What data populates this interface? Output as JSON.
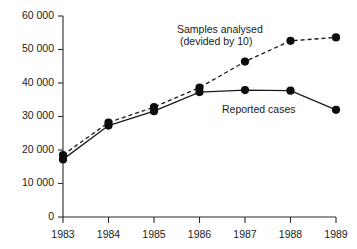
{
  "chart_data": {
    "type": "line",
    "title": "",
    "xlabel": "",
    "ylabel": "",
    "x": [
      1983,
      1984,
      1985,
      1986,
      1987,
      1988,
      1989
    ],
    "categories": [
      "1983",
      "1984",
      "1985",
      "1986",
      "1987",
      "1988",
      "1989"
    ],
    "xtick_labels": [
      "1983",
      "1984",
      "1985",
      "1986",
      "1987",
      "1988",
      "1989"
    ],
    "ytick_labels": [
      "0",
      "10 000",
      "20 000",
      "30 000",
      "40 000",
      "50 000",
      "60 000"
    ],
    "ytick_values": [
      0,
      10000,
      20000,
      30000,
      40000,
      50000,
      60000
    ],
    "ylim": [
      0,
      60000
    ],
    "xlim": [
      1983,
      1989
    ],
    "grid": false,
    "legend_position": "inline-annotation",
    "series": [
      {
        "name": "Samples analysed (devided by 10)",
        "style": "dashed",
        "marker": "filled-circle",
        "values": [
          18500,
          28200,
          32800,
          38600,
          46400,
          52600,
          53600
        ]
      },
      {
        "name": "Reported cases",
        "style": "solid",
        "marker": "filled-circle",
        "values": [
          17200,
          27300,
          31600,
          37300,
          37900,
          37700,
          32000
        ]
      }
    ],
    "annotations": [
      {
        "name": "samples-annotation",
        "line1": "Samples analysed",
        "line2": "(devided by 10)"
      },
      {
        "name": "reported-annotation",
        "line1": "Reported cases"
      }
    ],
    "colors": {
      "axis": "#2b2b2b",
      "line": "#1a1a1a",
      "marker": "#0d0d0d",
      "background": "#ffffff",
      "text": "#1a1a1a"
    }
  }
}
